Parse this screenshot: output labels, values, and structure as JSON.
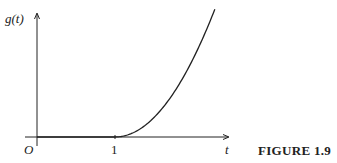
{
  "figure": {
    "caption": "FIGURE 1.9",
    "ylabel": "g(t)",
    "xlabel": "t",
    "origin_label": "O",
    "xticks": [
      {
        "value": 1,
        "label": "1"
      }
    ]
  },
  "chart_data": {
    "type": "line",
    "title": "",
    "xlabel": "t",
    "ylabel": "g(t)",
    "function": "g(t) = 0 for t <= 1, (t-1)^2 for t > 1",
    "x": [
      0,
      1,
      1.25,
      1.5,
      1.75,
      2.0,
      2.28
    ],
    "y": [
      0,
      0,
      0.0625,
      0.25,
      0.5625,
      1.0,
      1.64
    ],
    "xticks": [
      1
    ],
    "xlim": [
      -0.15,
      2.45
    ],
    "ylim": [
      0,
      1.9
    ],
    "grid": false,
    "legend": null
  }
}
